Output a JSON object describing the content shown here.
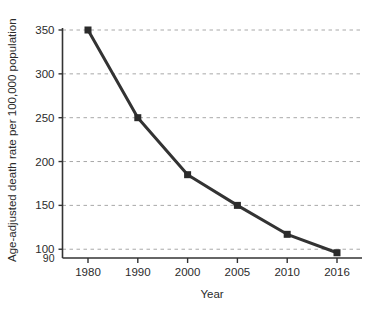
{
  "chart_data": {
    "type": "line",
    "title": "",
    "xlabel": "Year",
    "ylabel": "Age-adjusted death rate per 100,000 population",
    "categories": [
      "1980",
      "1990",
      "2000",
      "2005",
      "2010",
      "2016"
    ],
    "x": [
      1980,
      1990,
      2000,
      2005,
      2010,
      2016
    ],
    "values": [
      350,
      250,
      185,
      150,
      117,
      96
    ],
    "series": [
      {
        "name": "Age-adjusted death rate",
        "values": [
          350,
          250,
          185,
          150,
          117,
          96
        ]
      }
    ],
    "ylim": [
      90,
      350
    ],
    "ytick_labels": [
      "350",
      "300",
      "250",
      "200",
      "150",
      "100",
      "90"
    ],
    "ytick_values": [
      350,
      300,
      250,
      200,
      150,
      100,
      90
    ],
    "gridline_values": [
      350,
      300,
      250,
      200,
      150,
      100
    ],
    "xtick_labels": [
      "1980",
      "1990",
      "2000",
      "2005",
      "2010",
      "2016"
    ],
    "grid": "horizontal-dashed",
    "legend": "none",
    "marker": "square",
    "colors": {
      "line": "#333333",
      "marker": "#2b2b2b",
      "axis": "#333333",
      "grid": "#a8a8a8",
      "text": "#2b2b2b",
      "background": "#ffffff"
    }
  },
  "axis": {
    "y_title": "Age-adjusted death rate per 100,000 population",
    "x_title": "Year",
    "y_ticks": [
      {
        "label": "350",
        "value": 350
      },
      {
        "label": "300",
        "value": 300
      },
      {
        "label": "250",
        "value": 250
      },
      {
        "label": "200",
        "value": 200
      },
      {
        "label": "150",
        "value": 150
      },
      {
        "label": "100",
        "value": 100
      },
      {
        "label": "90",
        "value": 90
      }
    ],
    "x_ticks": [
      {
        "label": "1980",
        "value": 1980
      },
      {
        "label": "1990",
        "value": 1990
      },
      {
        "label": "2000",
        "value": 2000
      },
      {
        "label": "2005",
        "value": 2005
      },
      {
        "label": "2010",
        "value": 2010
      },
      {
        "label": "2016",
        "value": 2016
      }
    ]
  }
}
